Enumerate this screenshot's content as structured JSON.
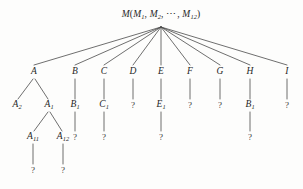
{
  "figure": {
    "background_color": "#fdfdfc",
    "line_color": "#4a4a4a",
    "text_color": "#262626"
  },
  "root": {
    "id": "M",
    "label_main": "M",
    "label_open": "(",
    "label_parts": [
      "M",
      "1",
      ",",
      "M",
      "2",
      ",",
      "⋯",
      ",",
      "M",
      "12"
    ],
    "label_plain": "M(M1, M2, ⋯, M12)",
    "x": 161,
    "y": 15
  },
  "levels": {
    "level2_y": 72,
    "level3_y": 105,
    "level4_y": 137,
    "level5_y": 170
  },
  "nodes": [
    {
      "id": "A",
      "base": "A",
      "sub": "",
      "x": 34,
      "y": 72,
      "kind": "letter"
    },
    {
      "id": "B",
      "base": "B",
      "sub": "",
      "x": 75,
      "y": 72,
      "kind": "letter"
    },
    {
      "id": "C",
      "base": "C",
      "sub": "",
      "x": 104,
      "y": 72,
      "kind": "letter"
    },
    {
      "id": "D",
      "base": "D",
      "sub": "",
      "x": 133,
      "y": 72,
      "kind": "letter"
    },
    {
      "id": "E",
      "base": "E",
      "sub": "",
      "x": 161,
      "y": 72,
      "kind": "letter"
    },
    {
      "id": "F",
      "base": "F",
      "sub": "",
      "x": 190,
      "y": 72,
      "kind": "letter"
    },
    {
      "id": "G",
      "base": "G",
      "sub": "",
      "x": 220,
      "y": 72,
      "kind": "letter"
    },
    {
      "id": "H",
      "base": "H",
      "sub": "",
      "x": 250,
      "y": 72,
      "kind": "letter"
    },
    {
      "id": "I",
      "base": "I",
      "sub": "",
      "x": 287,
      "y": 72,
      "kind": "letter"
    },
    {
      "id": "A2",
      "base": "A",
      "sub": "2",
      "x": 17,
      "y": 105,
      "kind": "letter"
    },
    {
      "id": "A1",
      "base": "A",
      "sub": "1",
      "x": 49,
      "y": 105,
      "kind": "letter"
    },
    {
      "id": "B1",
      "base": "B",
      "sub": "1",
      "x": 75,
      "y": 105,
      "kind": "letter"
    },
    {
      "id": "C1",
      "base": "C",
      "sub": "1",
      "x": 104,
      "y": 105,
      "kind": "letter"
    },
    {
      "id": "Dq",
      "base": "?",
      "sub": "",
      "x": 133,
      "y": 105,
      "kind": "question"
    },
    {
      "id": "E1",
      "base": "E",
      "sub": "1",
      "x": 161,
      "y": 105,
      "kind": "letter"
    },
    {
      "id": "Fq",
      "base": "?",
      "sub": "",
      "x": 190,
      "y": 105,
      "kind": "question"
    },
    {
      "id": "Gq",
      "base": "?",
      "sub": "",
      "x": 220,
      "y": 105,
      "kind": "question"
    },
    {
      "id": "HB1",
      "base": "B",
      "sub": "1",
      "x": 250,
      "y": 105,
      "kind": "letter"
    },
    {
      "id": "Iq",
      "base": "?",
      "sub": "",
      "x": 287,
      "y": 105,
      "kind": "question"
    },
    {
      "id": "A11",
      "base": "A",
      "sub": "11",
      "x": 33,
      "y": 137,
      "kind": "letter"
    },
    {
      "id": "A12",
      "base": "A",
      "sub": "12",
      "x": 63,
      "y": 137,
      "kind": "letter"
    },
    {
      "id": "B1q",
      "base": "?",
      "sub": "",
      "x": 75,
      "y": 137,
      "kind": "question"
    },
    {
      "id": "C1q",
      "base": "?",
      "sub": "",
      "x": 104,
      "y": 137,
      "kind": "question"
    },
    {
      "id": "E1q",
      "base": "?",
      "sub": "",
      "x": 161,
      "y": 137,
      "kind": "question"
    },
    {
      "id": "HB1q",
      "base": "?",
      "sub": "",
      "x": 250,
      "y": 137,
      "kind": "question"
    },
    {
      "id": "A11q",
      "base": "?",
      "sub": "",
      "x": 33,
      "y": 170,
      "kind": "question"
    },
    {
      "id": "A12q",
      "base": "?",
      "sub": "",
      "x": 63,
      "y": 170,
      "kind": "question"
    }
  ],
  "edges": [
    {
      "from": "M",
      "to": "A",
      "x1": 161,
      "y1": 27,
      "x2": 34,
      "y2": 65
    },
    {
      "from": "M",
      "to": "B",
      "x1": 161,
      "y1": 27,
      "x2": 75,
      "y2": 65
    },
    {
      "from": "M",
      "to": "C",
      "x1": 161,
      "y1": 27,
      "x2": 104,
      "y2": 65
    },
    {
      "from": "M",
      "to": "D",
      "x1": 161,
      "y1": 27,
      "x2": 133,
      "y2": 65
    },
    {
      "from": "M",
      "to": "E",
      "x1": 161,
      "y1": 27,
      "x2": 161,
      "y2": 65
    },
    {
      "from": "M",
      "to": "F",
      "x1": 161,
      "y1": 27,
      "x2": 190,
      "y2": 65
    },
    {
      "from": "M",
      "to": "G",
      "x1": 161,
      "y1": 27,
      "x2": 220,
      "y2": 65
    },
    {
      "from": "M",
      "to": "H",
      "x1": 161,
      "y1": 27,
      "x2": 250,
      "y2": 65
    },
    {
      "from": "M",
      "to": "I",
      "x1": 161,
      "y1": 27,
      "x2": 287,
      "y2": 65
    },
    {
      "from": "A",
      "to": "A2",
      "x1": 33,
      "y1": 79,
      "x2": 18,
      "y2": 99
    },
    {
      "from": "A",
      "to": "A1",
      "x1": 35,
      "y1": 79,
      "x2": 48,
      "y2": 99
    },
    {
      "from": "B",
      "to": "B1",
      "x1": 75,
      "y1": 79,
      "x2": 75,
      "y2": 99
    },
    {
      "from": "C",
      "to": "C1",
      "x1": 104,
      "y1": 79,
      "x2": 104,
      "y2": 99
    },
    {
      "from": "D",
      "to": "Dq",
      "x1": 133,
      "y1": 79,
      "x2": 133,
      "y2": 99
    },
    {
      "from": "E",
      "to": "E1",
      "x1": 161,
      "y1": 79,
      "x2": 161,
      "y2": 99
    },
    {
      "from": "F",
      "to": "Fq",
      "x1": 190,
      "y1": 79,
      "x2": 190,
      "y2": 99
    },
    {
      "from": "G",
      "to": "Gq",
      "x1": 220,
      "y1": 79,
      "x2": 220,
      "y2": 99
    },
    {
      "from": "H",
      "to": "HB1",
      "x1": 250,
      "y1": 79,
      "x2": 250,
      "y2": 99
    },
    {
      "from": "I",
      "to": "Iq",
      "x1": 287,
      "y1": 79,
      "x2": 287,
      "y2": 99
    },
    {
      "from": "A1",
      "to": "A11",
      "x1": 48,
      "y1": 112,
      "x2": 34,
      "y2": 131
    },
    {
      "from": "A1",
      "to": "A12",
      "x1": 50,
      "y1": 112,
      "x2": 62,
      "y2": 131
    },
    {
      "from": "B1",
      "to": "B1q",
      "x1": 75,
      "y1": 112,
      "x2": 75,
      "y2": 131
    },
    {
      "from": "C1",
      "to": "C1q",
      "x1": 104,
      "y1": 112,
      "x2": 104,
      "y2": 131
    },
    {
      "from": "E1",
      "to": "E1q",
      "x1": 161,
      "y1": 112,
      "x2": 161,
      "y2": 131
    },
    {
      "from": "HB1",
      "to": "HB1q",
      "x1": 250,
      "y1": 112,
      "x2": 250,
      "y2": 131
    },
    {
      "from": "A11",
      "to": "A11q",
      "x1": 33,
      "y1": 144,
      "x2": 33,
      "y2": 164
    },
    {
      "from": "A12",
      "to": "A12q",
      "x1": 63,
      "y1": 144,
      "x2": 63,
      "y2": 164
    }
  ]
}
